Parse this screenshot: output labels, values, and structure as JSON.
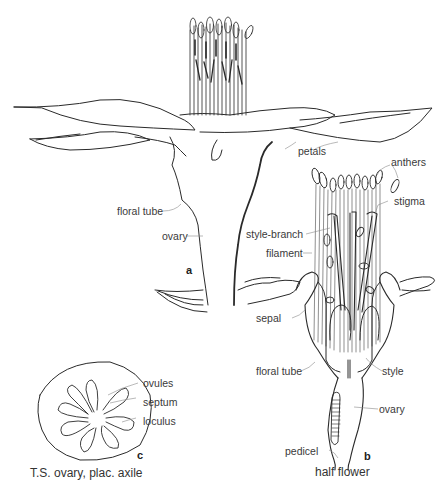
{
  "figure": {
    "panels": [
      {
        "id": "a",
        "letter": "a",
        "labels": {
          "petals": "petals",
          "floral_tube": "floral tube",
          "ovary": "ovary"
        }
      },
      {
        "id": "b",
        "letter": "b",
        "caption": "half flower",
        "labels": {
          "anthers": "anthers",
          "stigma": "stigma",
          "style_branch": "style-branch",
          "filament": "filament",
          "sepal": "sepal",
          "floral_tube": "floral tube",
          "style": "style",
          "ovary": "ovary",
          "pedicel": "pedicel"
        }
      },
      {
        "id": "c",
        "letter": "c",
        "caption": "T.S. ovary, plac. axile",
        "labels": {
          "ovules": "ovules",
          "septum": "septum",
          "loculus": "loculus"
        }
      }
    ]
  },
  "colors": {
    "line": "#2a2a2a",
    "leader": "#888888",
    "text": "#3a3a3a",
    "background": "#ffffff"
  }
}
